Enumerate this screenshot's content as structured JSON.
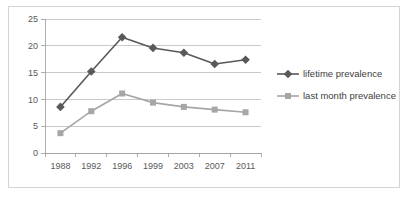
{
  "chart_data": {
    "type": "line",
    "title": "",
    "subtitle": "",
    "xlabel": "",
    "ylabel": "",
    "categories": [
      "1988",
      "1992",
      "1996",
      "1999",
      "2003",
      "2007",
      "2011"
    ],
    "ylim": [
      0,
      25
    ],
    "ytick_labels": [
      "0",
      "5",
      "10",
      "15",
      "20",
      "25"
    ],
    "ytick_values": [
      0,
      5,
      10,
      15,
      20,
      25
    ],
    "grid": "horizontal",
    "legend_position": "right",
    "series": [
      {
        "name": "lifetime prevalence",
        "color": "#595959",
        "marker": "diamond",
        "values": [
          8.6,
          15.2,
          21.6,
          19.6,
          18.7,
          16.6,
          17.4
        ]
      },
      {
        "name": "last month prevalence",
        "color": "#a6a6a6",
        "marker": "square",
        "values": [
          3.7,
          7.8,
          11.1,
          9.4,
          8.6,
          8.1,
          7.6
        ]
      }
    ]
  },
  "legend": {
    "entries": [
      {
        "label": "lifetime prevalence"
      },
      {
        "label": "last month prevalence"
      }
    ]
  },
  "style": {
    "plot_background": "#ffffff",
    "border_color": "#d4d4d4",
    "gridline_color": "#b3b3b3",
    "axis_color": "#9a9a9a",
    "tick_text_color": "#595959",
    "legend_text_color": "#404040"
  }
}
